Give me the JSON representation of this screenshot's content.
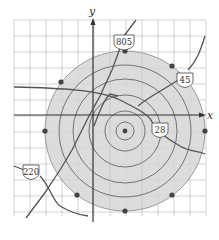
{
  "diagram": {
    "axes": {
      "x_label": "x",
      "y_label": "y"
    },
    "grid": {
      "x0": 14,
      "y0": 20,
      "x1": 206,
      "y1": 216,
      "step": 16
    },
    "center": {
      "x": 125,
      "y": 130
    },
    "rings": [
      8,
      20,
      36,
      52,
      66,
      80
    ],
    "shaded_radius": 80,
    "colors": {
      "shade": "#d9d9d9",
      "grid": "#c8c8c8",
      "lines": "#555555",
      "dots": "#444444",
      "axis": "#333333"
    },
    "highways": [
      {
        "name": "805",
        "label": "805"
      },
      {
        "name": "45",
        "label": "45"
      },
      {
        "name": "28",
        "label": "28"
      },
      {
        "name": "220",
        "label": "220"
      }
    ],
    "points": 9
  }
}
